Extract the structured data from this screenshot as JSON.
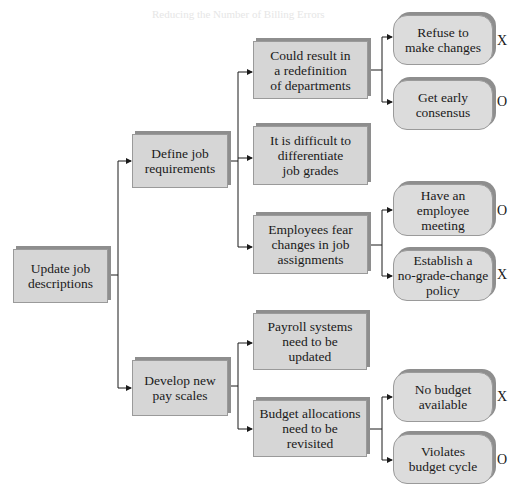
{
  "ghost_title": "Reducing the Number of Billing Errors",
  "root": {
    "label": "Update job\ndescriptions"
  },
  "level1": [
    {
      "label": "Define job\nrequirements"
    },
    {
      "label": "Develop new\npay scales"
    }
  ],
  "level2": [
    {
      "label": "Could result in\na redefinition\nof departments"
    },
    {
      "label": "It is difficult to\ndifferentiate\njob grades"
    },
    {
      "label": "Employees fear\nchanges in job\nassignments"
    },
    {
      "label": "Payroll systems\nneed to be\nupdated"
    },
    {
      "label": "Budget allocations\nneed to be\nrevisited"
    }
  ],
  "level3": [
    {
      "label": "Refuse to\nmake changes",
      "mark": "X"
    },
    {
      "label": "Get early\nconsensus",
      "mark": "O"
    },
    {
      "label": "Have an\nemployee\nmeeting",
      "mark": "O"
    },
    {
      "label": "Establish a\nno-grade-change\npolicy",
      "mark": "X"
    },
    {
      "label": "No budget\navailable",
      "mark": "X"
    },
    {
      "label": "Violates\nbudget cycle",
      "mark": "O"
    }
  ]
}
